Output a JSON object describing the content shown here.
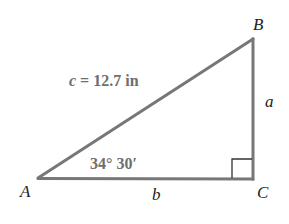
{
  "diagram": {
    "type": "right-triangle",
    "vertices": {
      "A": {
        "label": "A",
        "x": 38,
        "y": 178
      },
      "B": {
        "label": "B",
        "x": 253,
        "y": 39
      },
      "C": {
        "label": "C",
        "x": 253,
        "y": 179
      }
    },
    "sides": {
      "a": {
        "label": "a"
      },
      "b": {
        "label": "b"
      },
      "c": {
        "label": "c",
        "equals": "=",
        "value": "12.7 in"
      }
    },
    "angle_A": {
      "text": "34° 30′"
    },
    "right_angle_at": "C",
    "colors": {
      "stroke": "#777777",
      "right_angle_mark": "#333333",
      "measure_text": "#6e6e6e",
      "label_text": "#222222"
    }
  }
}
